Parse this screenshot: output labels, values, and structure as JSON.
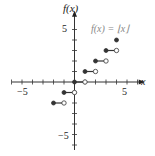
{
  "chart_data": {
    "type": "line",
    "title": "f(x) = ⌊x⌋",
    "xlabel": "x",
    "ylabel": "f(x)",
    "xlim": [
      -6,
      6
    ],
    "ylim": [
      -6,
      6
    ],
    "x_tick_labels": [
      "-5",
      "5"
    ],
    "y_tick_labels": [
      "5",
      "-5"
    ],
    "grid": false,
    "segments": [
      {
        "x_start": -2,
        "x_end": -1,
        "y": -2,
        "start_closed": true,
        "end_closed": false
      },
      {
        "x_start": -1,
        "x_end": 0,
        "y": -1,
        "start_closed": true,
        "end_closed": false
      },
      {
        "x_start": 0,
        "x_end": 1,
        "y": 0,
        "start_closed": true,
        "end_closed": false
      },
      {
        "x_start": 1,
        "x_end": 2,
        "y": 1,
        "start_closed": true,
        "end_closed": false
      },
      {
        "x_start": 2,
        "x_end": 3,
        "y": 2,
        "start_closed": true,
        "end_closed": false
      },
      {
        "x_start": 3,
        "x_end": 4,
        "y": 3,
        "start_closed": true,
        "end_closed": false
      }
    ],
    "points": [
      {
        "x": 4,
        "y": 4,
        "closed": true
      }
    ]
  },
  "labels": {
    "title": "f(x) = ⌊x⌋",
    "ylabel": "f(x)",
    "xlabel": "x",
    "x_neg5": "−5",
    "x_pos5": "5",
    "y_pos5": "5",
    "y_neg5": "−5"
  }
}
